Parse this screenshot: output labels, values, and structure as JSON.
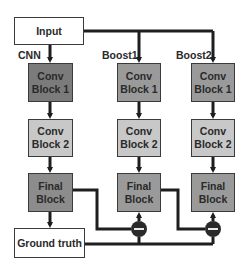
{
  "diagram": {
    "input_label": "Input",
    "ground_truth_label": "Ground truth",
    "columns": [
      {
        "label": "CNN",
        "blocks": [
          {
            "line1": "Conv",
            "line2": "Block 1",
            "color": "#7b7b7b"
          },
          {
            "line1": "Conv",
            "line2": "Block 2",
            "color": "#c8c8c8"
          },
          {
            "line1": "Final",
            "line2": "Block",
            "color": "#8c8c8c"
          }
        ]
      },
      {
        "label": "Boost1",
        "blocks": [
          {
            "line1": "Conv",
            "line2": "Block 1",
            "color": "#9a9a9a"
          },
          {
            "line1": "Conv",
            "line2": "Block 2",
            "color": "#c8c8c8"
          },
          {
            "line1": "Final",
            "line2": "Block",
            "color": "#9a9a9a"
          }
        ]
      },
      {
        "label": "Boost2",
        "blocks": [
          {
            "line1": "Conv",
            "line2": "Block 1",
            "color": "#9a9a9a"
          },
          {
            "line1": "Conv",
            "line2": "Block 2",
            "color": "#c8c8c8"
          },
          {
            "line1": "Final",
            "line2": "Block",
            "color": "#9a9a9a"
          }
        ]
      }
    ],
    "operators": [
      {
        "symbol": "minus",
        "column": "Boost1"
      },
      {
        "symbol": "minus",
        "column": "Boost2"
      }
    ],
    "colors": {
      "line": "#1e1e1e",
      "box_border": "#3a3a3a",
      "io_fill": "#ffffff",
      "operator_fill": "#2a2a2a"
    }
  }
}
